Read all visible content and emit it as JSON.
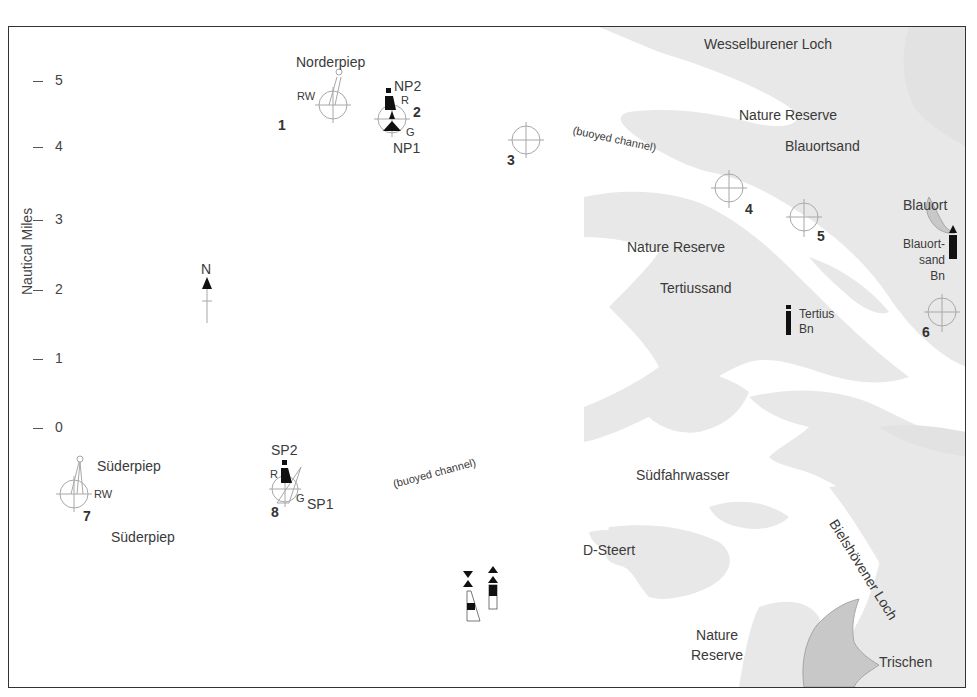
{
  "map": {
    "axis": {
      "title": "Nautical Miles",
      "ticks": [
        "5",
        "4",
        "3",
        "2",
        "1",
        "0"
      ]
    },
    "colors": {
      "sandbank": "#e6e6e6",
      "island": "#c9c9c9",
      "frame": "#333333",
      "text": "#3a3a3a",
      "waypoint": "#aaaaaa"
    },
    "compass": {
      "label": "N",
      "icon": "north-arrow-icon"
    },
    "waypoints": [
      {
        "number": "1",
        "label": "RW"
      },
      {
        "number": "2"
      },
      {
        "number": "3"
      },
      {
        "number": "4"
      },
      {
        "number": "5"
      },
      {
        "number": "6"
      },
      {
        "number": "7",
        "label": "RW"
      },
      {
        "number": "8"
      }
    ],
    "buoys": {
      "np2": "NP2",
      "np1": "NP1",
      "np_r": "R",
      "np_g": "G",
      "sp2": "SP2",
      "sp1": "SP1",
      "sp_r": "R",
      "sp_g": "G"
    },
    "beacons": {
      "tertius": [
        "Tertius",
        "Bn"
      ],
      "blauortsand": [
        "Blauort-",
        "sand",
        "Bn"
      ]
    },
    "place_names": {
      "norderpiep": "Norderpiep",
      "wesselburener_loch": "Wesselburener Loch",
      "nature_reserve_north": "Nature Reserve",
      "blauortsand": "Blauortsand",
      "buoyed_channel_north": "(buoyed channel)",
      "blauort": "Blauort",
      "nature_reserve_mid": "Nature Reserve",
      "tertiussand": "Tertiussand",
      "suderpiep_top": "Süderpiep",
      "suderpiep_bottom": "Süderpiep",
      "buoyed_channel_south": "(buoyed channel)",
      "sudfahrwasser": "Südfahrwasser",
      "d_steert": "D-Steert",
      "bielshovener_loch": "Bielshövener Loch",
      "nature_reserve_south_1": "Nature",
      "nature_reserve_south_2": "Reserve",
      "trischen": "Trischen"
    }
  }
}
